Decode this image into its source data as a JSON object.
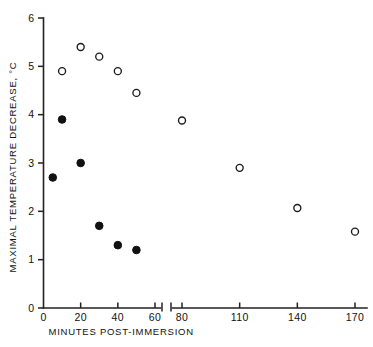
{
  "chart_data": {
    "type": "scatter",
    "title": "",
    "xlabel": "MINUTES POST-IMMERSION",
    "ylabel": "MAXIMAL TEMPERATURE DECREASE, °C",
    "xlim": [
      0,
      170
    ],
    "ylim": [
      0,
      6
    ],
    "grid": false,
    "legend": "none",
    "x_ticks": [
      "0",
      "20",
      "40",
      "60",
      "80",
      "110",
      "140",
      "170"
    ],
    "x_tick_values": [
      0,
      20,
      40,
      60,
      80,
      110,
      140,
      170
    ],
    "y_ticks": [
      "0",
      "1",
      "2",
      "3",
      "4",
      "5",
      "6"
    ],
    "y_tick_values": [
      0,
      1,
      2,
      3,
      4,
      5,
      6
    ],
    "axis_break": {
      "present": true,
      "between": [
        60,
        80
      ],
      "style": "double-slash"
    },
    "series": [
      {
        "name": "open-circles",
        "marker": "open circle",
        "color": "#111111",
        "points": [
          {
            "x": 10,
            "y": 4.9
          },
          {
            "x": 20,
            "y": 5.4
          },
          {
            "x": 30,
            "y": 5.2
          },
          {
            "x": 40,
            "y": 4.9
          },
          {
            "x": 50,
            "y": 4.45
          },
          {
            "x": 80,
            "y": 3.88
          },
          {
            "x": 110,
            "y": 2.9
          },
          {
            "x": 140,
            "y": 2.07
          },
          {
            "x": 170,
            "y": 1.58
          }
        ]
      },
      {
        "name": "filled-circles",
        "marker": "filled circle",
        "color": "#111111",
        "points": [
          {
            "x": 5,
            "y": 2.7
          },
          {
            "x": 10,
            "y": 3.9
          },
          {
            "x": 20,
            "y": 3.0
          },
          {
            "x": 30,
            "y": 1.7
          },
          {
            "x": 40,
            "y": 1.3
          },
          {
            "x": 50,
            "y": 1.2
          }
        ]
      }
    ]
  },
  "figure": {
    "background": "#ffffff",
    "axis_color": "#222222"
  }
}
